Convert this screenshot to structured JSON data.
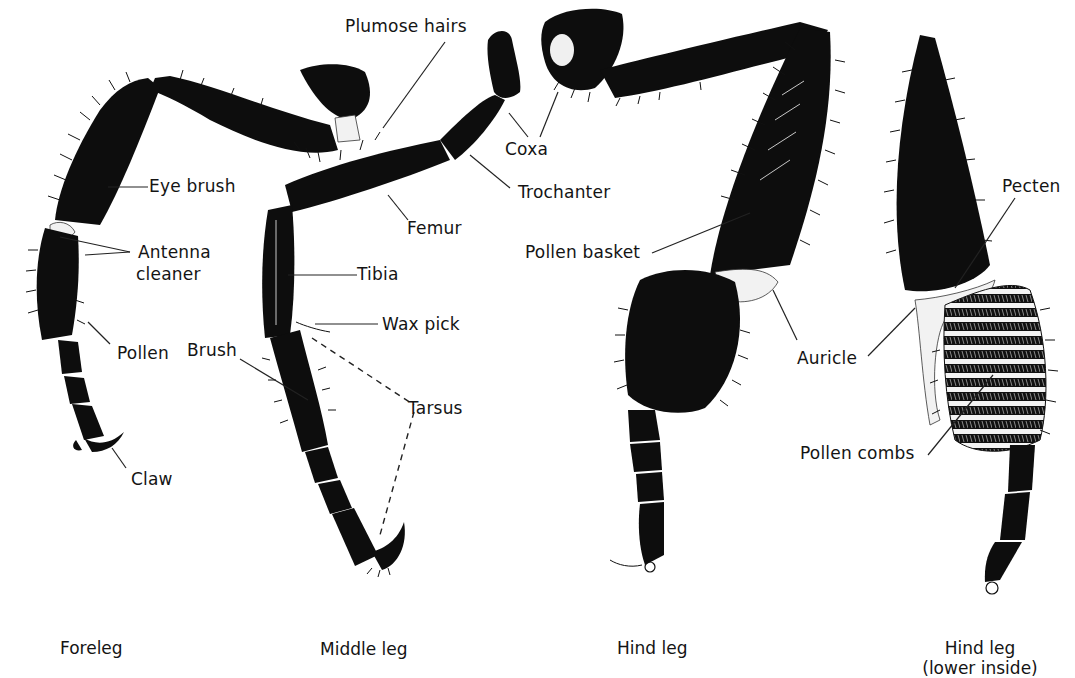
{
  "figure": {
    "panels": [
      {
        "id": "foreleg",
        "caption": "Foreleg"
      },
      {
        "id": "middle",
        "caption": "Middle leg"
      },
      {
        "id": "hind",
        "caption": "Hind leg"
      },
      {
        "id": "hind_inside",
        "caption_line1": "Hind leg",
        "caption_line2": "(lower inside)"
      }
    ],
    "labels": {
      "plumose_hairs": "Plumose hairs",
      "coxa": "Coxa",
      "trochanter": "Trochanter",
      "eye_brush": "Eye brush",
      "femur": "Femur",
      "antenna_cleaner_1": "Antenna",
      "antenna_cleaner_2": "cleaner",
      "tibia": "Tibia",
      "wax_pick": "Wax pick",
      "pollen": "Pollen",
      "brush": "Brush",
      "tarsus": "Tarsus",
      "claw": "Claw",
      "pollen_basket": "Pollen basket",
      "pecten": "Pecten",
      "auricle": "Auricle",
      "pollen_combs": "Pollen combs"
    },
    "colors": {
      "ink": "#0d0d0d",
      "paper": "#ffffff"
    }
  }
}
